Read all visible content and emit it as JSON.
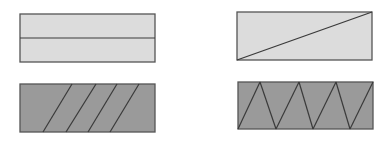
{
  "figure": {
    "colors": {
      "light_fill": "#dcdcdc",
      "dark_fill": "#9a9a9a",
      "stroke": "#555555",
      "line": "#3a3a3a",
      "background": "#ffffff"
    },
    "panels": [
      {
        "id": "top-left",
        "rect": {
          "x": 20,
          "y": 14,
          "w": 135,
          "h": 48
        },
        "fill": "light",
        "division": "horizontal-midline",
        "lines": [
          [
            20,
            38,
            155,
            38
          ]
        ]
      },
      {
        "id": "top-right",
        "rect": {
          "x": 237,
          "y": 12,
          "w": 135,
          "h": 48
        },
        "fill": "light",
        "division": "diagonal",
        "lines": [
          [
            237,
            60,
            372,
            12
          ]
        ]
      },
      {
        "id": "bottom-left",
        "rect": {
          "x": 20,
          "y": 84,
          "w": 135,
          "h": 48
        },
        "fill": "dark",
        "division": "parallel-slants",
        "lines": [
          [
            43,
            132,
            72,
            84
          ],
          [
            66,
            132,
            96,
            84
          ],
          [
            88,
            132,
            117,
            84
          ],
          [
            110,
            132,
            139,
            84
          ]
        ]
      },
      {
        "id": "bottom-right",
        "rect": {
          "x": 238,
          "y": 82,
          "w": 135,
          "h": 47
        },
        "fill": "dark",
        "division": "zigzag-triangles",
        "lines": [
          [
            238,
            129,
            260,
            82
          ],
          [
            260,
            82,
            276,
            129
          ],
          [
            276,
            129,
            299,
            82
          ],
          [
            299,
            82,
            313,
            129
          ],
          [
            313,
            129,
            336,
            82
          ],
          [
            336,
            82,
            350,
            129
          ],
          [
            350,
            129,
            373,
            82
          ]
        ]
      }
    ]
  }
}
